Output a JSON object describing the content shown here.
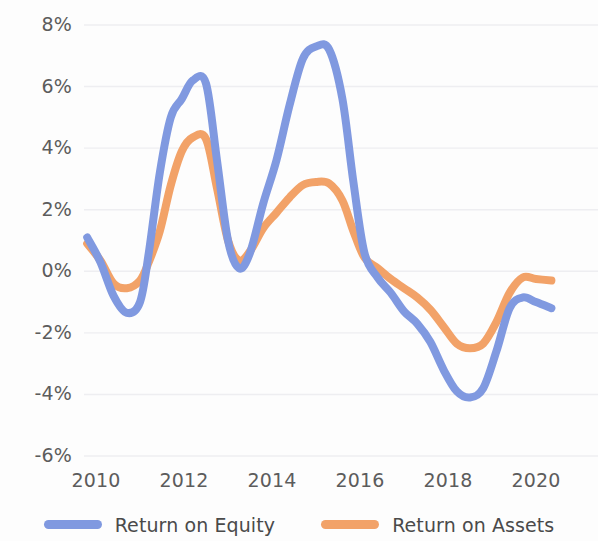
{
  "chart_data": {
    "type": "line",
    "title": "",
    "subtitle": "",
    "xlabel": "",
    "ylabel": "",
    "xlim": [
      2009.6,
      2020.7
    ],
    "ylim": [
      -6,
      8
    ],
    "grid": true,
    "grid_axis": "y",
    "legend_position": "bottom",
    "x_tick_labels": [
      "2010",
      "2012",
      "2014",
      "2016",
      "2018",
      "2020"
    ],
    "x_ticks": [
      2010,
      2012,
      2014,
      2016,
      2018,
      2020
    ],
    "y_tick_labels": [
      "8%",
      "6%",
      "4%",
      "2%",
      "0%",
      "-2%",
      "-4%",
      "-6%"
    ],
    "y_ticks": [
      8,
      6,
      4,
      2,
      0,
      -2,
      -4,
      -6
    ],
    "y_unit": "%",
    "series": [
      {
        "name": "Return on Equity",
        "color": "#8099e0",
        "x": [
          2009.8,
          2010.1,
          2010.4,
          2010.7,
          2011.0,
          2011.2,
          2011.45,
          2011.7,
          2011.95,
          2012.2,
          2012.5,
          2012.75,
          2013.0,
          2013.25,
          2013.5,
          2013.8,
          2014.1,
          2014.4,
          2014.7,
          2015.0,
          2015.3,
          2015.6,
          2015.85,
          2016.1,
          2016.4,
          2016.7,
          2017.0,
          2017.3,
          2017.6,
          2017.9,
          2018.2,
          2018.5,
          2018.8,
          2019.1,
          2019.4,
          2019.7,
          2020.0,
          2020.35
        ],
        "y": [
          1.1,
          0.3,
          -0.8,
          -1.35,
          -1.0,
          0.6,
          3.2,
          5.0,
          5.6,
          6.2,
          6.1,
          3.6,
          1.0,
          0.1,
          0.6,
          2.2,
          3.6,
          5.4,
          6.9,
          7.3,
          7.2,
          5.6,
          2.9,
          0.6,
          -0.2,
          -0.7,
          -1.3,
          -1.7,
          -2.3,
          -3.2,
          -3.9,
          -4.1,
          -3.8,
          -2.6,
          -1.2,
          -0.85,
          -1.0,
          -1.2
        ]
      },
      {
        "name": "Return on Assets",
        "color": "#f2a268",
        "x": [
          2009.8,
          2010.1,
          2010.4,
          2010.7,
          2011.0,
          2011.2,
          2011.45,
          2011.7,
          2011.95,
          2012.2,
          2012.5,
          2012.75,
          2013.0,
          2013.25,
          2013.5,
          2013.8,
          2014.1,
          2014.4,
          2014.7,
          2015.0,
          2015.3,
          2015.6,
          2015.85,
          2016.1,
          2016.4,
          2016.7,
          2017.0,
          2017.3,
          2017.6,
          2017.9,
          2018.2,
          2018.5,
          2018.8,
          2019.1,
          2019.4,
          2019.7,
          2020.0,
          2020.35
        ],
        "y": [
          0.9,
          0.35,
          -0.4,
          -0.55,
          -0.3,
          0.3,
          1.3,
          2.8,
          3.9,
          4.35,
          4.3,
          2.7,
          1.0,
          0.35,
          0.65,
          1.4,
          1.9,
          2.4,
          2.8,
          2.9,
          2.85,
          2.3,
          1.3,
          0.45,
          0.1,
          -0.25,
          -0.55,
          -0.85,
          -1.25,
          -1.8,
          -2.35,
          -2.5,
          -2.35,
          -1.65,
          -0.7,
          -0.2,
          -0.25,
          -0.3
        ]
      }
    ],
    "key_points": {
      "roe_peak_2012": 6.2,
      "roe_peak_2015": 7.3,
      "roe_trough_2010": -1.35,
      "roe_trough_2018": -4.1,
      "roa_peak_2012": 4.35,
      "roa_peak_2015": 2.9,
      "roa_trough_2010": -0.55,
      "roa_trough_2018": -2.5
    }
  },
  "axes": {
    "y_labels": [
      "8%",
      "6%",
      "4%",
      "2%",
      "0%",
      "-2%",
      "-4%",
      "-6%"
    ],
    "x_labels": [
      "2010",
      "2012",
      "2014",
      "2016",
      "2018",
      "2020"
    ]
  },
  "legend": {
    "items": [
      {
        "label": "Return on Equity",
        "color": "#8099e0"
      },
      {
        "label": "Return on Assets",
        "color": "#f2a268"
      }
    ]
  },
  "style": {
    "background": "#fdfdfd",
    "gridline_color": "#eeeef1",
    "tick_text_color": "#5c5c5c",
    "legend_text_color": "#4a4a4a",
    "series_blue": "#8099e0",
    "series_orange": "#f2a268",
    "line_width": 8
  }
}
